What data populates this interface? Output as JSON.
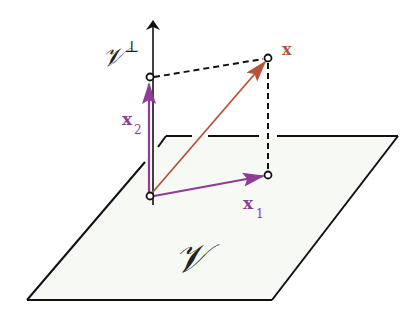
{
  "diagram": {
    "colors": {
      "background": "#ffffff",
      "plane_fill": "#f7f9f5",
      "plane_stroke": "#111111",
      "axis": "#111111",
      "vector_x": "#b5533c",
      "vector_components": "#8e3c96",
      "dashed": "#111111"
    },
    "plane": {
      "label": "𝒱",
      "corners": [
        [
          166,
          136
        ],
        [
          398,
          136
        ],
        [
          272,
          300
        ],
        [
          27,
          300
        ]
      ]
    },
    "axis": {
      "label": "𝒱",
      "superscript": "⊥",
      "from": [
        153,
        205
      ],
      "to": [
        153,
        18
      ]
    },
    "vectors": {
      "x": {
        "label": "x",
        "from": [
          150,
          196
        ],
        "to": [
          268,
          58
        ]
      },
      "x1": {
        "label": "x",
        "subscript": "1",
        "from": [
          150,
          196
        ],
        "to": [
          268,
          175
        ]
      },
      "x2": {
        "label": "x",
        "subscript": "2",
        "from": [
          150,
          196
        ],
        "to": [
          150,
          77
        ]
      }
    },
    "points": {
      "origin": [
        150,
        196
      ],
      "x_tip": [
        268,
        58
      ],
      "x1_tip": [
        268,
        175
      ],
      "x2_tip": [
        150,
        77
      ]
    }
  }
}
